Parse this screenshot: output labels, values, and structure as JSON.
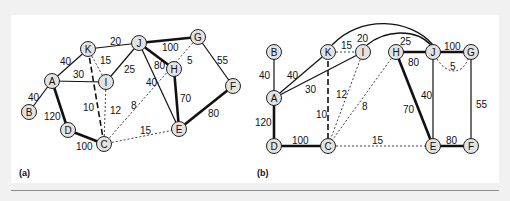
{
  "figure": {
    "panels": [
      {
        "caption": "(a)",
        "nodes": [
          {
            "id": "A",
            "x": 52,
            "y": 81
          },
          {
            "id": "B",
            "x": 29,
            "y": 112
          },
          {
            "id": "C",
            "x": 104,
            "y": 144
          },
          {
            "id": "D",
            "x": 68,
            "y": 130
          },
          {
            "id": "E",
            "x": 179,
            "y": 129
          },
          {
            "id": "F",
            "x": 233,
            "y": 86
          },
          {
            "id": "G",
            "x": 198,
            "y": 37
          },
          {
            "id": "H",
            "x": 174,
            "y": 69
          },
          {
            "id": "I",
            "x": 106,
            "y": 82
          },
          {
            "id": "J",
            "x": 139,
            "y": 43
          },
          {
            "id": "K",
            "x": 88,
            "y": 49
          }
        ],
        "edges": [
          {
            "from": "A",
            "to": "B",
            "weight": "40",
            "style": "solid"
          },
          {
            "from": "A",
            "to": "K",
            "weight": "40",
            "style": "solid"
          },
          {
            "from": "A",
            "to": "I",
            "weight": "30",
            "style": "solid"
          },
          {
            "from": "A",
            "to": "D",
            "weight": "120",
            "style": "bold"
          },
          {
            "from": "D",
            "to": "C",
            "weight": "100",
            "style": "bold"
          },
          {
            "from": "K",
            "to": "J",
            "weight": "20",
            "style": "solid"
          },
          {
            "from": "K",
            "to": "I",
            "weight": "15",
            "style": "dotted"
          },
          {
            "from": "K",
            "to": "C",
            "weight": "10",
            "style": "dashed"
          },
          {
            "from": "I",
            "to": "J",
            "weight": "25",
            "style": "solid"
          },
          {
            "from": "I",
            "to": "C",
            "weight": "12",
            "style": "dotted"
          },
          {
            "from": "J",
            "to": "G",
            "weight": "100",
            "style": "bold"
          },
          {
            "from": "J",
            "to": "H",
            "weight": "80",
            "style": "bold"
          },
          {
            "from": "J",
            "to": "E",
            "weight": "40",
            "style": "solid"
          },
          {
            "from": "H",
            "to": "E",
            "weight": "70",
            "style": "bold"
          },
          {
            "from": "G",
            "to": "C",
            "weight": "8",
            "style": "dotted"
          },
          {
            "from": "G",
            "to": "H",
            "weight": "5",
            "style": "none"
          },
          {
            "from": "G",
            "to": "F",
            "weight": "55",
            "style": "solid"
          },
          {
            "from": "F",
            "to": "E",
            "weight": "80",
            "style": "bold"
          },
          {
            "from": "C",
            "to": "E",
            "weight": "15",
            "style": "dotted"
          }
        ]
      },
      {
        "caption": "(b)",
        "nodes": [
          {
            "id": "A",
            "x": 274,
            "y": 98
          },
          {
            "id": "B",
            "x": 274,
            "y": 52
          },
          {
            "id": "C",
            "x": 328,
            "y": 146
          },
          {
            "id": "D",
            "x": 274,
            "y": 146
          },
          {
            "id": "E",
            "x": 433,
            "y": 146
          },
          {
            "id": "F",
            "x": 471,
            "y": 146
          },
          {
            "id": "G",
            "x": 471,
            "y": 52
          },
          {
            "id": "H",
            "x": 396,
            "y": 52
          },
          {
            "id": "I",
            "x": 363,
            "y": 52
          },
          {
            "id": "J",
            "x": 433,
            "y": 52
          },
          {
            "id": "K",
            "x": 328,
            "y": 52
          }
        ],
        "edges": [
          {
            "from": "A",
            "to": "B",
            "weight": "40",
            "style": "solid"
          },
          {
            "from": "A",
            "to": "K",
            "weight": "40",
            "style": "solid"
          },
          {
            "from": "A",
            "to": "I",
            "weight": "30",
            "style": "solid"
          },
          {
            "from": "A",
            "to": "D",
            "weight": "120",
            "style": "bold"
          },
          {
            "from": "D",
            "to": "C",
            "weight": "100",
            "style": "bold"
          },
          {
            "from": "K",
            "to": "J",
            "weight": "20",
            "style": "arc"
          },
          {
            "from": "K",
            "to": "I",
            "weight": "15",
            "style": "dotted"
          },
          {
            "from": "K",
            "to": "C",
            "weight": "10",
            "style": "dashed"
          },
          {
            "from": "I",
            "to": "J",
            "weight": "25",
            "style": "arc"
          },
          {
            "from": "I",
            "to": "C",
            "weight": "12",
            "style": "dotted"
          },
          {
            "from": "H",
            "to": "C",
            "weight": "8",
            "style": "dotted"
          },
          {
            "from": "H",
            "to": "J",
            "weight": "80",
            "style": "bold"
          },
          {
            "from": "H",
            "to": "E",
            "weight": "70",
            "style": "bold"
          },
          {
            "from": "J",
            "to": "G",
            "weight": "100",
            "style": "bold"
          },
          {
            "from": "J",
            "to": "G",
            "weight": "5",
            "style": "dotted-arc"
          },
          {
            "from": "J",
            "to": "E",
            "weight": "40",
            "style": "solid"
          },
          {
            "from": "G",
            "to": "F",
            "weight": "55",
            "style": "solid"
          },
          {
            "from": "E",
            "to": "F",
            "weight": "80",
            "style": "bold"
          },
          {
            "from": "C",
            "to": "E",
            "weight": "15",
            "style": "dotted"
          }
        ]
      }
    ]
  },
  "labels": {
    "a": {
      "caption": "(a)",
      "w_AB": "40",
      "w_AK": "40",
      "w_AI": "30",
      "w_AD": "120",
      "w_DC": "100",
      "w_KJ": "20",
      "w_KI": "15",
      "w_KC": "10",
      "w_IJ": "25",
      "w_IC": "12",
      "w_JG": "100",
      "w_JH": "80",
      "w_JE": "40",
      "w_HE": "70",
      "w_GC": "8",
      "w_GH": "5",
      "w_GF": "55",
      "w_FE": "80",
      "w_CE": "15"
    },
    "b": {
      "caption": "(b)",
      "w_AB": "40",
      "w_AK": "40",
      "w_AI": "30",
      "w_AD": "120",
      "w_DC": "100",
      "w_KJ": "20",
      "w_KI": "15",
      "w_KC": "10",
      "w_IJ": "25",
      "w_IC": "12",
      "w_HC": "8",
      "w_HJ": "80",
      "w_HE": "70",
      "w_JG": "100",
      "w_JG2": "5",
      "w_JE": "40",
      "w_GF": "55",
      "w_EF": "80",
      "w_CE": "15"
    }
  }
}
